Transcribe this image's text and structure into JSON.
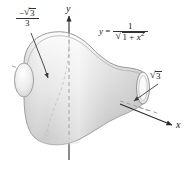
{
  "figure": {
    "background_color": "#ffffff",
    "surface_fill_light": "#f4f4f4",
    "surface_fill_mid": "#d9d9d9",
    "surface_fill_dark": "#b3b3b3",
    "outline_color": "#8c8c8c",
    "axis_color": "#2b2b2b",
    "dashed_color": "#9a9a9a",
    "leader_color": "#3a3a3a"
  },
  "axes": {
    "y_label": "y",
    "x_label": "x"
  },
  "equation": {
    "lhs": "y",
    "equals": "=",
    "numerator": "1",
    "radicand_a": "1 + ",
    "radicand_var": "x",
    "radicand_exp": "2"
  },
  "labels": {
    "left_bound": {
      "numerator_sign": "−",
      "numerator_radicand": "3",
      "denominator": "3"
    },
    "right_bound": {
      "radicand": "3"
    }
  }
}
